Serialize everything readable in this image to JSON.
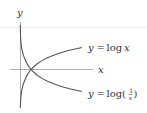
{
  "diagram": {
    "axis_x_label": "x",
    "axis_y_label": "y",
    "curves": [
      {
        "name": "log x",
        "label_lhs": "y",
        "label_eq": "=",
        "label_fn": "log",
        "label_arg": "x"
      },
      {
        "name": "log(1/x)",
        "label_lhs": "y",
        "label_eq": "=",
        "label_fn": "log(",
        "label_num": "1",
        "label_den": "x",
        "label_close": ")"
      }
    ],
    "colors": {
      "axis": "#9a9a9a",
      "curve": "#555555",
      "guide": "#e6e6e6",
      "text": "#333333"
    }
  }
}
